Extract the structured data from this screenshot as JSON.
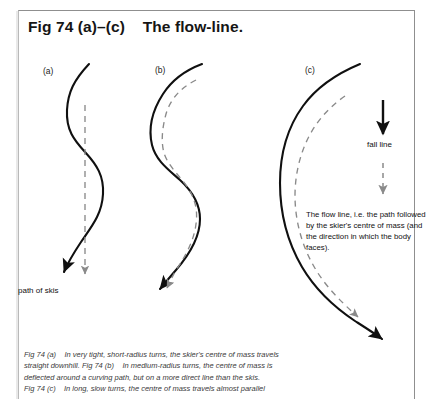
{
  "page": {
    "background_color": "#ffffff",
    "frame_color": "#8f8f8f"
  },
  "title": "Fig 74 (a)–(c)    The flow-line.",
  "panels": [
    {
      "id": "a",
      "label": "(a)"
    },
    {
      "id": "b",
      "label": "(b)"
    },
    {
      "id": "c",
      "label": "(c)"
    }
  ],
  "annotations": {
    "path_of_skis": "path of skis",
    "fall_line": "fall line"
  },
  "flow_note": "The flow line, i.e. the path followed by the skier's centre of mass (and the direction in which the body faces).",
  "caption": {
    "lines": [
      "Fig 74 (a)    In very tight, short-radius turns, the skier's centre of mass travels",
      "straight downhill. Fig 74 (b)    In medium-radius turns, the centre of mass is",
      "deflected around a curving path, but on a more direct line than the skis.",
      "Fig 74 (c)    In long, slow turns, the centre of mass travels almost parallel"
    ]
  },
  "legend": {
    "solid_arrow_meaning": "fall line",
    "dashed_arrow_meaning": "flow line"
  },
  "colors": {
    "ski_path_stroke": "#101010",
    "flow_line_stroke": "#8a8a8a",
    "text": "#111111",
    "caption_text": "#3a3a3a"
  }
}
